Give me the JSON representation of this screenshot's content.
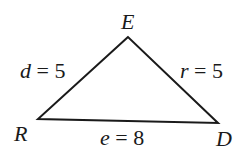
{
  "diagram": {
    "type": "triangle",
    "vertices": [
      {
        "name": "E",
        "x": 128,
        "y": 37
      },
      {
        "name": "R",
        "x": 38,
        "y": 119
      },
      {
        "name": "D",
        "x": 218,
        "y": 123
      }
    ],
    "vertex_labels": {
      "E": "E",
      "R": "R",
      "D": "D"
    },
    "sides": {
      "d": {
        "var": "d",
        "eq": " = 5",
        "between": [
          "R",
          "E"
        ]
      },
      "r": {
        "var": "r",
        "eq": " = 5",
        "between": [
          "E",
          "D"
        ]
      },
      "e": {
        "var": "e",
        "eq": " = 8",
        "between": [
          "R",
          "D"
        ]
      }
    },
    "stroke_color": "#1a1a1a"
  }
}
